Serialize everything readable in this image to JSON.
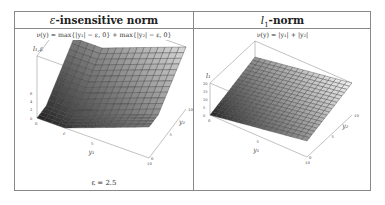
{
  "table": {
    "columns": [
      {
        "header_symbol": "ε",
        "header_text": "-insensitive norm",
        "formula": "ν(y) = max{|y₁| − ε, 0} + max{|y₂| − ε, 0}",
        "note": "ε = 2.5",
        "plot": {
          "z_axis_label": "l₁,ε",
          "z_ticks": [
            "0",
            "2",
            "4",
            "6"
          ],
          "x_axis_label": "y₁",
          "x_ticks": [
            "0",
            "ε",
            "5",
            "10"
          ],
          "y_axis_label": "y₂",
          "y_ticks": [
            "0",
            "5",
            "10"
          ],
          "epsilon_marker": "ε"
        }
      },
      {
        "header_symbol": "l",
        "header_sub": "1",
        "header_text": "-norm",
        "formula": "ν(y) = |y₁| + |y₂|",
        "plot": {
          "z_axis_label": "l₁",
          "z_ticks": [
            "0",
            "5",
            "10",
            "15",
            "20"
          ],
          "x_axis_label": "y₁",
          "x_ticks": [
            "0",
            "5",
            "10"
          ],
          "y_axis_label": "y₂",
          "y_ticks": [
            "0",
            "5",
            "10"
          ]
        }
      }
    ]
  },
  "chart_data": [
    {
      "type": "surface",
      "title": "ε-insensitive norm",
      "function": "max(|y1|-eps,0)+max(|y2|-eps,0)",
      "parameters": {
        "epsilon": 2.5
      },
      "xlabel": "y1",
      "ylabel": "y2",
      "zlabel": "l_{1,ε}",
      "xlim": [
        0,
        10
      ],
      "ylim": [
        0,
        10
      ],
      "zlim": [
        0,
        15
      ],
      "z_ticks": [
        0,
        2,
        4,
        6
      ],
      "grid": true
    },
    {
      "type": "surface",
      "title": "l1-norm",
      "function": "|y1|+|y2|",
      "xlabel": "y1",
      "ylabel": "y2",
      "zlabel": "l_1",
      "xlim": [
        0,
        10
      ],
      "ylim": [
        0,
        10
      ],
      "zlim": [
        0,
        20
      ],
      "z_ticks": [
        0,
        5,
        10,
        15,
        20
      ],
      "grid": true
    }
  ]
}
